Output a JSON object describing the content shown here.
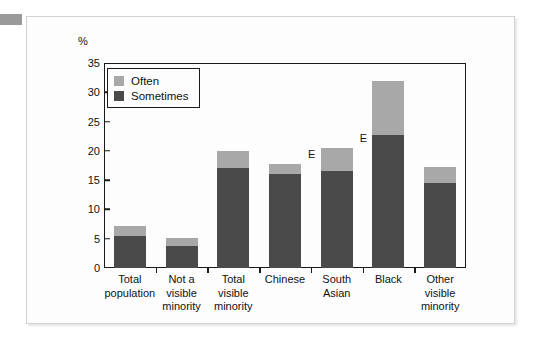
{
  "chart_data": {
    "type": "bar",
    "subtype": "stacked-vertical",
    "title": "",
    "xlabel": "",
    "ylabel": "%",
    "ylim": [
      0,
      35
    ],
    "yticks": [
      0,
      5,
      10,
      15,
      20,
      25,
      30,
      35
    ],
    "ytick_labels": [
      "0",
      "5",
      "10",
      "15",
      "20",
      "25",
      "30",
      "35"
    ],
    "grid": false,
    "legend_position": "top-left-inside",
    "categories": [
      "Total population",
      "Not a visible minority",
      "Total visible minority",
      "Chinese",
      "South Asian",
      "Black",
      "Other visible minority"
    ],
    "category_lines": [
      [
        "Total",
        "population"
      ],
      [
        "Not a",
        "visible",
        "minority"
      ],
      [
        "Total",
        "visible",
        "minority"
      ],
      [
        "Chinese"
      ],
      [
        "South",
        "Asian"
      ],
      [
        "Black"
      ],
      [
        "Other",
        "visible",
        "minority"
      ]
    ],
    "series": [
      {
        "name": "Sometimes",
        "color": "#4a4a4a",
        "values": [
          5.4,
          3.8,
          17.0,
          16.0,
          16.6,
          22.7,
          14.6
        ]
      },
      {
        "name": "Often",
        "color": "#a8a8a8",
        "values": [
          1.8,
          1.4,
          3.0,
          1.8,
          3.9,
          9.2,
          2.7
        ]
      }
    ],
    "totals": [
      7.2,
      5.2,
      20.0,
      17.8,
      20.5,
      31.9,
      17.3
    ],
    "annotations": [
      {
        "text": "E",
        "category": "Chinese",
        "value": 19.3
      },
      {
        "text": "E",
        "category": "South Asian",
        "value": 22.1
      }
    ]
  },
  "legend": {
    "items": [
      {
        "label": "Often",
        "color": "#a8a8a8"
      },
      {
        "label": "Sometimes",
        "color": "#4a4a4a"
      }
    ]
  },
  "axis": {
    "unit_label": "%"
  }
}
